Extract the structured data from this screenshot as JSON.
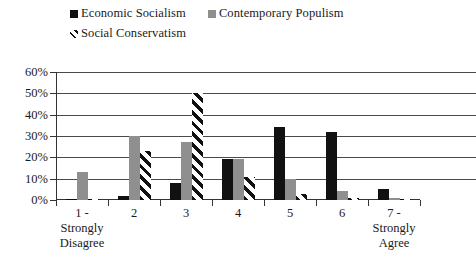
{
  "chart_data": {
    "type": "bar",
    "title": "",
    "subtitle": "",
    "xlabel": "",
    "ylabel": "",
    "ylim": [
      0,
      60
    ],
    "y_tick_labels": [
      "0%",
      "10%",
      "20%",
      "30%",
      "40%",
      "50%",
      "60%"
    ],
    "y_tick_values": [
      0,
      10,
      20,
      30,
      40,
      50,
      60
    ],
    "grid": true,
    "legend_position": "top",
    "categories": [
      "1",
      "2",
      "3",
      "4",
      "5",
      "6",
      "7"
    ],
    "category_labels": [
      {
        "number": "1 -",
        "line2": "Strongly",
        "line3": "Disagree"
      },
      {
        "number": "2",
        "line2": "",
        "line3": ""
      },
      {
        "number": "3",
        "line2": "",
        "line3": ""
      },
      {
        "number": "4",
        "line2": "",
        "line3": ""
      },
      {
        "number": "5",
        "line2": "",
        "line3": ""
      },
      {
        "number": "6",
        "line2": "",
        "line3": ""
      },
      {
        "number": "7 -",
        "line2": "Strongly",
        "line3": "Agree"
      }
    ],
    "series": [
      {
        "name": "Economic Socialism",
        "color": "#111111",
        "pattern": "solid",
        "values": [
          0.5,
          2,
          8,
          19,
          34,
          32,
          5
        ]
      },
      {
        "name": "Contemporary Populism",
        "color": "#8f8f8f",
        "pattern": "solid",
        "values": [
          13,
          30,
          27,
          19,
          10,
          4,
          1
        ]
      },
      {
        "name": "Social Conservatism",
        "color": "#111111",
        "pattern": "diagonal-hatch",
        "values": [
          0.5,
          23,
          50,
          11,
          3,
          1,
          0
        ]
      }
    ]
  },
  "legend": {
    "items": [
      {
        "label": "Economic Socialism",
        "swatch": "black-square-icon"
      },
      {
        "label": "Contemporary Populism",
        "swatch": "gray-square-icon"
      },
      {
        "label": "Social Conservatism",
        "swatch": "hatch-square-icon"
      }
    ]
  },
  "colors": {
    "series_black": "#111111",
    "series_gray": "#8f8f8f",
    "axis": "#333333",
    "gridline": "#4a4a4a",
    "background": "#ffffff"
  }
}
